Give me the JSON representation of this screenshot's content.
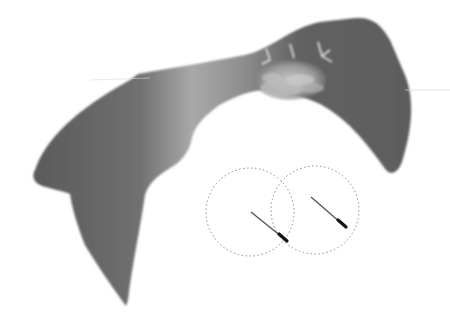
{
  "diagram": {
    "type": "anatomical illustration",
    "colors": {
      "background": "#ffffff",
      "body_dark": "#5e5e5e",
      "body_light": "#a8a8a8",
      "tissue_highlight": "#b5b5b5",
      "circle_stroke": "#8a8a8a",
      "needle": "#3a3a3a",
      "needle_tip": "#111111"
    },
    "elements": [
      {
        "name": "body-shape",
        "label": ""
      },
      {
        "name": "tissue-region",
        "label": ""
      },
      {
        "name": "target-circle-left",
        "label": ""
      },
      {
        "name": "target-circle-right",
        "label": ""
      },
      {
        "name": "needle-left",
        "label": ""
      },
      {
        "name": "needle-right",
        "label": ""
      }
    ]
  }
}
